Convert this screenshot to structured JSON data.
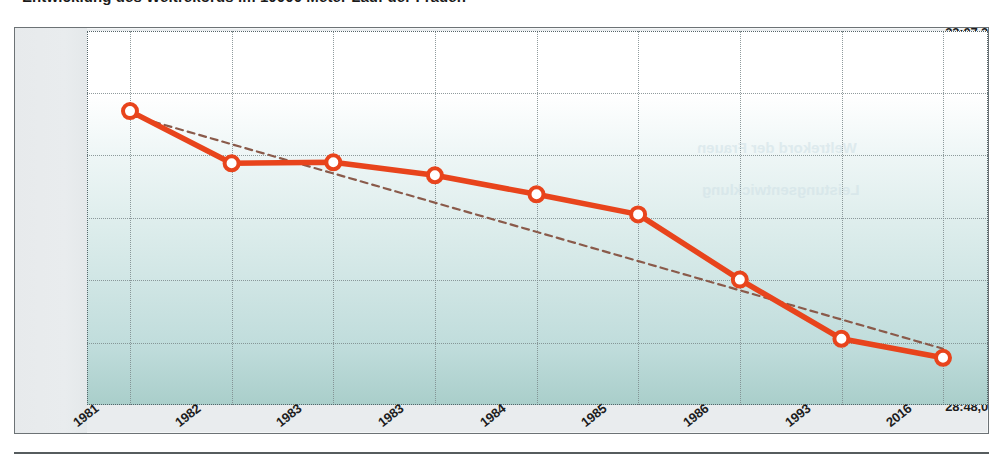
{
  "title": "Entwicklung des Weltrekords im 10000 Meter Lauf der Frauen",
  "axis": {
    "y_ticks": [
      "33:07,2",
      "32:24,0",
      "31:40,8",
      "30:57,6",
      "30:14,4",
      "29:31,2",
      "28:48,0"
    ],
    "x_ticks": [
      "1981",
      "1982",
      "1983",
      "1983",
      "1984",
      "1985",
      "1986",
      "1993",
      "2016"
    ]
  },
  "colors": {
    "series_line": "#e8441c",
    "series_marker_fill": "#ffffff",
    "trend_line": "#8a5a4a",
    "grid": "#7d8a8c",
    "plot_top": "#ffffff",
    "plot_bottom": "#a9ceca",
    "frame_bg": "#e9ecee",
    "frame_border": "#6c7275",
    "text": "#1d1d1d"
  },
  "chart_data": {
    "type": "line",
    "title": "Entwicklung des Weltrekords im 10000 Meter Lauf der Frauen",
    "xlabel": "",
    "ylabel": "",
    "grid": true,
    "legend": "none",
    "categories": [
      "1981",
      "1982",
      "1983",
      "1983",
      "1984",
      "1985",
      "1986",
      "1993",
      "2016"
    ],
    "ylim": [
      "28:48,0",
      "33:07,2"
    ],
    "ylim_seconds": [
      1728.0,
      1987.2
    ],
    "ytick_seconds": [
      1987.2,
      1944.0,
      1900.8,
      1857.6,
      1814.4,
      1771.2,
      1728.0
    ],
    "series": [
      {
        "name": "Weltrekord",
        "style": "solid-with-markers",
        "color": "#e8441c",
        "labels": [
          "32:11,7",
          "31:35,5",
          "31:36,2",
          "31:27,2",
          "31:14,0",
          "31:00,1",
          "30:14,9",
          "29:33,9",
          "29:20,7"
        ],
        "values_seconds": [
          1931.7,
          1895.5,
          1896.2,
          1887.2,
          1874.0,
          1860.1,
          1814.9,
          1773.9,
          1760.7
        ]
      },
      {
        "name": "Trendlinie",
        "style": "dashed",
        "color": "#8a5a4a",
        "endpoints_seconds": [
          1929.0,
          1767.0
        ],
        "endpoints_labels": [
          "32:09",
          "29:27"
        ]
      }
    ]
  },
  "bleed_text": {
    "line1": "Weltrekord der Frauen",
    "line2": "Leistungsentwicklung"
  }
}
